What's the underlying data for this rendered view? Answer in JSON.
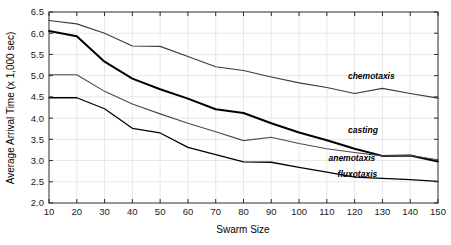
{
  "chart_data": {
    "type": "line",
    "title": "",
    "xlabel": "Swarm Size",
    "ylabel": "Average Arrival Time (x 1,000 sec)",
    "xlim": [
      10,
      150
    ],
    "ylim": [
      2.0,
      6.5
    ],
    "xticks": [
      10,
      20,
      30,
      40,
      50,
      60,
      70,
      80,
      90,
      100,
      110,
      120,
      130,
      140,
      150
    ],
    "yticks": [
      2.0,
      2.5,
      3.0,
      3.5,
      4.0,
      4.5,
      5.0,
      5.5,
      6.0,
      6.5
    ],
    "ytick_labels": [
      "2.0",
      "2.5",
      "3.0",
      "3.5",
      "4.0",
      "4.5",
      "5.0",
      "5.5",
      "6.0",
      "6.5"
    ],
    "xtick_labels": [
      "10",
      "20",
      "30",
      "40",
      "50",
      "60",
      "70",
      "80",
      "90",
      "100",
      "110",
      "120",
      "130",
      "140",
      "150"
    ],
    "grid": true,
    "legend": "inline-annotations",
    "x": [
      10,
      20,
      30,
      40,
      50,
      60,
      70,
      80,
      90,
      100,
      110,
      120,
      130,
      140,
      150
    ],
    "series": [
      {
        "name": "chemotaxis",
        "color": "#3a3a3a",
        "width": 1.1,
        "values": [
          6.3,
          6.22,
          6.0,
          5.7,
          5.69,
          5.45,
          5.21,
          5.12,
          4.97,
          4.83,
          4.72,
          4.58,
          4.7,
          4.58,
          4.47
        ],
        "label_x": 126,
        "label_y": 4.92
      },
      {
        "name": "casting",
        "color": "#000000",
        "width": 2.0,
        "values": [
          6.05,
          5.93,
          5.33,
          4.93,
          4.68,
          4.46,
          4.21,
          4.12,
          3.88,
          3.66,
          3.48,
          3.28,
          3.11,
          3.12,
          2.98
        ],
        "label_x": 123,
        "label_y": 3.64
      },
      {
        "name": "anemotaxis",
        "color": "#4a4a4a",
        "width": 1.1,
        "values": [
          5.02,
          5.02,
          4.63,
          4.33,
          4.1,
          3.88,
          3.68,
          3.47,
          3.55,
          3.4,
          3.28,
          3.19,
          3.11,
          3.12,
          3.02
        ],
        "label_x": 119,
        "label_y": 2.98
      },
      {
        "name": "fluxotaxis",
        "color": "#000000",
        "width": 1.3,
        "values": [
          4.48,
          4.48,
          4.22,
          3.76,
          3.65,
          3.31,
          3.14,
          2.97,
          2.96,
          2.84,
          2.73,
          2.61,
          2.58,
          2.55,
          2.51
        ],
        "label_x": 121,
        "label_y": 2.62
      }
    ]
  }
}
